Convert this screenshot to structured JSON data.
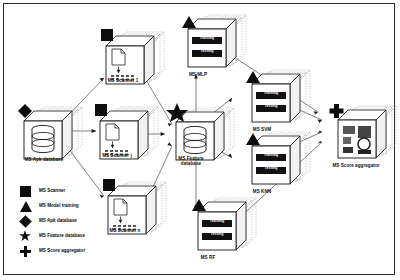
{
  "diagram": {
    "background": "#ffffff",
    "ink": "#0d0d0d",
    "frame_border": "#2b2b2b"
  },
  "nodes": [
    {
      "id": "scanner1",
      "label": "MS Scanner 1",
      "kind": "scanner",
      "glyph": "square-marker",
      "stack": 3,
      "inner": "document-scan"
    },
    {
      "id": "scannerj",
      "label": "MS Scanner j",
      "kind": "scanner",
      "glyph": "square-marker",
      "stack": 3,
      "inner": "document-scan"
    },
    {
      "id": "scannern",
      "label": "MS Scanner n",
      "kind": "scanner",
      "glyph": "square-marker",
      "stack": 3,
      "inner": "document-scan"
    },
    {
      "id": "apkdb",
      "label": "MS Apk database",
      "kind": "database",
      "glyph": "diamond-marker",
      "stack": 3,
      "inner": "cylinder-db"
    },
    {
      "id": "featdb",
      "label": "MS Feature\ndatabase",
      "kind": "database",
      "glyph": "star-marker",
      "stack": 3,
      "inner": "cylinder-db"
    },
    {
      "id": "mlp",
      "label": "MS MLP",
      "kind": "model",
      "glyph": "triangle-marker",
      "stack": 3,
      "inner": "train-test-bars"
    },
    {
      "id": "svm",
      "label": "MS SVM",
      "kind": "model",
      "glyph": "triangle-marker",
      "stack": 3,
      "inner": "train-test-bars"
    },
    {
      "id": "knn",
      "label": "MS KNN",
      "kind": "model",
      "glyph": "triangle-marker",
      "stack": 3,
      "inner": "train-test-bars"
    },
    {
      "id": "rf",
      "label": "MS RF",
      "kind": "model",
      "glyph": "triangle-marker",
      "stack": 3,
      "inner": "train-test-bars"
    },
    {
      "id": "aggregator",
      "label": "MS Score aggregator",
      "kind": "aggregator",
      "glyph": "plus-marker",
      "stack": 3,
      "inner": "chart-grid"
    }
  ],
  "model_box": {
    "train_label": "Training",
    "test_label": "Testing"
  },
  "legend": {
    "items": [
      {
        "glyph": "square-marker",
        "label": "MS Scanner"
      },
      {
        "glyph": "triangle-marker",
        "label": "MS Model training"
      },
      {
        "glyph": "diamond-marker",
        "label": "MS Apk database"
      },
      {
        "glyph": "star-marker",
        "label": "MS Feature database"
      },
      {
        "glyph": "plus-marker",
        "label": "MS Score aggregator"
      }
    ]
  },
  "edges": [
    {
      "from": "apkdb",
      "to": "scanner1"
    },
    {
      "from": "apkdb",
      "to": "scannerj"
    },
    {
      "from": "apkdb",
      "to": "scannern"
    },
    {
      "from": "scanner1",
      "to": "featdb"
    },
    {
      "from": "scannerj",
      "to": "featdb"
    },
    {
      "from": "scannern",
      "to": "featdb"
    },
    {
      "from": "featdb",
      "to": "mlp"
    },
    {
      "from": "featdb",
      "to": "svm"
    },
    {
      "from": "featdb",
      "to": "knn"
    },
    {
      "from": "featdb",
      "to": "rf"
    },
    {
      "from": "mlp",
      "to": "aggregator"
    },
    {
      "from": "svm",
      "to": "aggregator"
    },
    {
      "from": "knn",
      "to": "aggregator"
    },
    {
      "from": "rf",
      "to": "aggregator"
    }
  ]
}
